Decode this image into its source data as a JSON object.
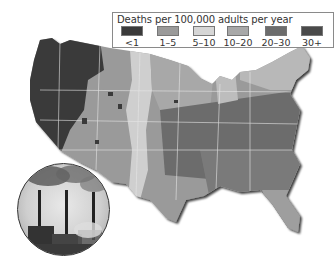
{
  "legend": {
    "title": "Deaths per 100,000 adults per year",
    "items": [
      {
        "label": "<1",
        "color": "#3a3a3a"
      },
      {
        "label": "1–5",
        "color": "#9a9a9a"
      },
      {
        "label": "5–10",
        "color": "#d6d6d6"
      },
      {
        "label": "10–20",
        "color": "#a8a8a8"
      },
      {
        "label": "20–30",
        "color": "#6c6c6c"
      },
      {
        "label": "30+",
        "color": "#4a4a4a"
      }
    ]
  },
  "map": {
    "region": "contiguous United States",
    "colors": {
      "west": "#3a3a3a",
      "plains_light": "#cfcfcf",
      "mid": "#9a9a9a",
      "east_dark": "#6c6c6c",
      "southeast": "#7a7a7a",
      "borders": "#e6e6e6",
      "shadow": "#222222"
    }
  },
  "inset": {
    "subject": "power plant smokestacks emitting smoke"
  }
}
